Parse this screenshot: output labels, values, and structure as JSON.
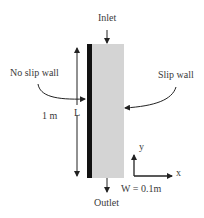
{
  "diagram": {
    "labels": {
      "inlet": "Inlet",
      "outlet": "Outlet",
      "no_slip_wall": "No slip wall",
      "slip_wall": "Slip wall",
      "length_value": "1 m",
      "length_symbol": "L",
      "width": "W = 0.1m",
      "axis_x": "x",
      "axis_y": "y"
    },
    "colors": {
      "channel_fill": "#d4d4d4",
      "no_slip_wall": "#111111",
      "lines": "#222222"
    }
  }
}
